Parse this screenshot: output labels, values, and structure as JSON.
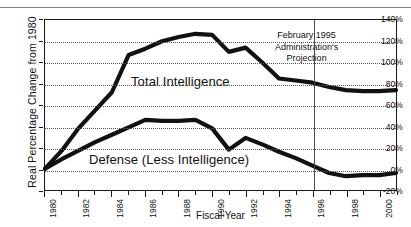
{
  "ghost_title": "",
  "axis": {
    "ylabel": "Real Percentage Change from 1980",
    "xlabel": "Fiscal Year"
  },
  "annotation": {
    "line1": "February 1995",
    "line2": "Administration's",
    "line3": "Projection"
  },
  "series_labels": {
    "total": "Total Intelligence",
    "defense": "Defense (Less Intelligence)"
  },
  "chart_data": {
    "type": "line",
    "title": "",
    "xlabel": "Fiscal Year",
    "ylabel": "Real Percentage Change from 1980",
    "xlim": [
      1980,
      2001
    ],
    "ylim": [
      -20,
      140
    ],
    "ytick_labels": [
      "140%",
      "120%",
      "100%",
      "80%",
      "60%",
      "40%",
      "20%",
      "0%",
      "-20%"
    ],
    "ytick_values": [
      140,
      120,
      100,
      80,
      60,
      40,
      20,
      0,
      -20
    ],
    "xtick_labels": [
      "1980",
      "1982",
      "1984",
      "1986",
      "1988",
      "1990",
      "1992",
      "1994",
      "1996",
      "1998",
      "2000"
    ],
    "xtick_values": [
      1980,
      1982,
      1984,
      1986,
      1988,
      1990,
      1992,
      1994,
      1996,
      1998,
      2000
    ],
    "xtick_minor_values": [
      1981,
      1983,
      1985,
      1987,
      1989,
      1991,
      1993,
      1995,
      1997,
      1999,
      2001
    ],
    "grid": "horizontal-dotted",
    "legend": "inline-labels",
    "annotations": [
      {
        "text": "February 1995 Administration's Projection",
        "x": 1996,
        "type": "vertical-divider-with-text"
      }
    ],
    "x": [
      1980,
      1981,
      1982,
      1983,
      1984,
      1985,
      1986,
      1987,
      1988,
      1989,
      1990,
      1991,
      1992,
      1993,
      1994,
      1995,
      1996,
      1997,
      1998,
      1999,
      2000,
      2001
    ],
    "series": [
      {
        "name": "Total Intelligence",
        "values": [
          0,
          17,
          38,
          55,
          72,
          107,
          113,
          120,
          124,
          127,
          126,
          110,
          114,
          100,
          85,
          83,
          81,
          77,
          74,
          73,
          73,
          74
        ]
      },
      {
        "name": "Defense (Less Intelligence)",
        "values": [
          0,
          9,
          17,
          25,
          32,
          39,
          46,
          45,
          45,
          46,
          38,
          18,
          29,
          23,
          16,
          10,
          3,
          -4,
          -7,
          -6,
          -6,
          -4
        ]
      }
    ]
  }
}
